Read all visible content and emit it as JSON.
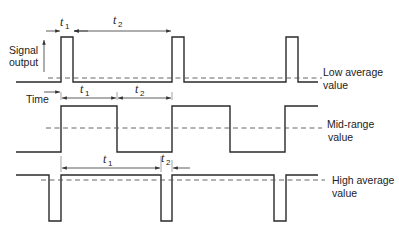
{
  "figure": {
    "axis": {
      "signal_label_line1": "Signal",
      "signal_label_line2": "output",
      "time_label": "Time"
    },
    "dimensions": {
      "t": "t",
      "sub1": "1",
      "sub2": "2"
    },
    "rows": [
      {
        "id": "low",
        "label_line1": "Low average",
        "label_line2": "value"
      },
      {
        "id": "mid",
        "label_line1": "Mid-range",
        "label_line2": "value"
      },
      {
        "id": "high",
        "label_line1": "High average",
        "label_line2": "value"
      }
    ],
    "colors": {
      "line": "#2a2a2a",
      "dashed": "#555555",
      "background": "#ffffff"
    }
  }
}
